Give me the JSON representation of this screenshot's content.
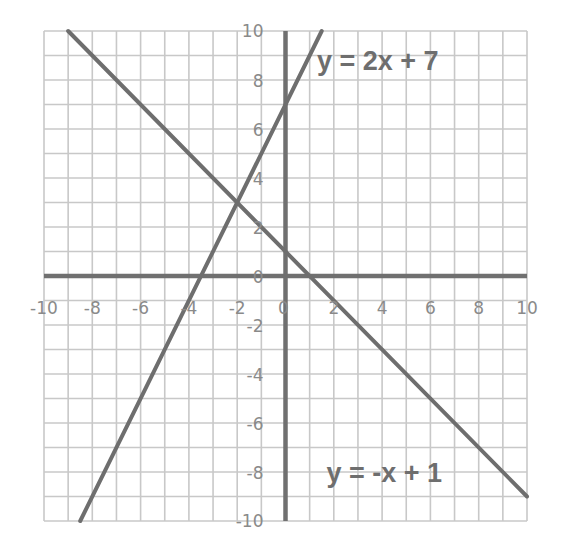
{
  "chart_data": {
    "type": "line",
    "title": "",
    "xlabel": "",
    "ylabel": "",
    "xlim": [
      -10,
      10
    ],
    "ylim": [
      -10,
      10
    ],
    "grid": true,
    "grid_step": 1,
    "x_ticks": [
      -10,
      -8,
      -6,
      -4,
      -2,
      0,
      2,
      4,
      6,
      8,
      10
    ],
    "y_ticks": [
      -10,
      -8,
      -6,
      -4,
      -2,
      0,
      2,
      4,
      6,
      8,
      10
    ],
    "x_tick_labels": [
      "-10",
      "-8",
      "-6",
      "-4",
      "-2",
      "0",
      "2",
      "4",
      "6",
      "8",
      "10"
    ],
    "y_tick_labels": [
      "-10",
      "-8",
      "-6",
      "-4",
      "-2",
      "0",
      "2",
      "4",
      "6",
      "8",
      "10"
    ],
    "series": [
      {
        "name": "y = 2x + 7",
        "slope": 2,
        "intercept": 7,
        "x": [
          -8.5,
          1.5
        ],
        "y": [
          -10,
          10
        ]
      },
      {
        "name": "y = -x + 1",
        "slope": -1,
        "intercept": 1,
        "x": [
          -9,
          10
        ],
        "y": [
          10,
          -9
        ]
      }
    ],
    "annotations": [
      {
        "text": "y = 2x + 7",
        "x": 1.3,
        "y": 8.4
      },
      {
        "text": "y = -x + 1",
        "x": 1.7,
        "y": -8.4
      }
    ],
    "intersection": {
      "x": -2,
      "y": 3
    },
    "legend": "none"
  },
  "labels": {
    "line1": "y = 2x + 7",
    "line2": "y = -x + 1"
  },
  "colors": {
    "grid": "#c8c8c8",
    "axis": "#707070",
    "line": "#6e6e6e",
    "tick_text": "#8a8a8a",
    "background": "#ffffff"
  }
}
